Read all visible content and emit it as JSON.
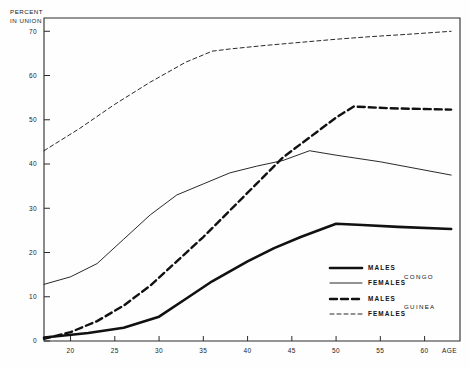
{
  "chart_data": {
    "type": "line",
    "title": "",
    "ylabel": "PERCENT IN UNION",
    "xlabel": "AGE",
    "xlim": [
      17,
      64
    ],
    "ylim": [
      0,
      73
    ],
    "xticks": [
      20,
      25,
      30,
      35,
      40,
      45,
      50,
      55,
      60
    ],
    "yticks": [
      0,
      10,
      20,
      30,
      40,
      50,
      60,
      70
    ],
    "grid": false,
    "legend_position": "inside-bottom-right",
    "series": [
      {
        "name": "MALES",
        "group": "CONGO",
        "style": "solid-thick",
        "x": [
          17,
          19,
          22,
          26,
          30,
          33,
          36,
          40,
          43,
          46,
          50,
          53,
          57,
          63
        ],
        "y": [
          0.8,
          1.2,
          1.8,
          3.0,
          5.5,
          9.5,
          13.5,
          18.0,
          21.0,
          23.5,
          26.5,
          26.2,
          25.8,
          25.3
        ]
      },
      {
        "name": "FEMALES",
        "group": "CONGO",
        "style": "solid-thin",
        "x": [
          17,
          20,
          23,
          26,
          29,
          32,
          35,
          38,
          41,
          44,
          47,
          50,
          55,
          63
        ],
        "y": [
          12.8,
          14.5,
          17.5,
          23.0,
          28.5,
          33.0,
          35.5,
          38.0,
          39.5,
          40.8,
          43.0,
          42.0,
          40.5,
          37.5
        ]
      },
      {
        "name": "MALES",
        "group": "GUINEA",
        "style": "dashed-thick",
        "x": [
          17,
          20,
          23,
          26,
          29,
          32,
          35,
          38,
          41,
          44,
          47,
          50,
          52,
          56,
          63
        ],
        "y": [
          0.5,
          2.0,
          4.5,
          8.0,
          12.5,
          18.0,
          23.5,
          29.5,
          35.5,
          41.5,
          46.0,
          50.5,
          53.0,
          52.6,
          52.3
        ]
      },
      {
        "name": "FEMALES",
        "group": "GUINEA",
        "style": "dashed-thin",
        "x": [
          17,
          21,
          25,
          29,
          33,
          36,
          38,
          42,
          46,
          50,
          54,
          58,
          63
        ],
        "y": [
          43.0,
          48.0,
          53.5,
          58.5,
          63.0,
          65.5,
          66.0,
          66.8,
          67.5,
          68.2,
          68.8,
          69.3,
          70.0
        ]
      }
    ]
  },
  "legend": {
    "entries": [
      {
        "label": "MALES",
        "style": "solid-thick"
      },
      {
        "label": "FEMALES",
        "style": "solid-thin"
      },
      {
        "label": "MALES",
        "style": "dashed-thick"
      },
      {
        "label": "FEMALES",
        "style": "dashed-thin"
      }
    ],
    "group_congo": "CONGO",
    "group_guinea": "GUINEA"
  },
  "axis": {
    "ylabel_line1": "PERCENT",
    "ylabel_line2": "IN UNION",
    "xlabel": "AGE"
  }
}
